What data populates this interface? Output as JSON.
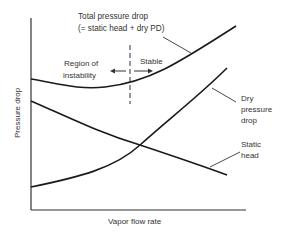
{
  "diagram": {
    "xlabel": "Vapor flow rate",
    "ylabel": "Pressure drop",
    "curves": [
      {
        "id": "total",
        "name": "Total pressure drop",
        "label_lines": [
          "Total pressure drop",
          "(= static head + dry PD)"
        ]
      },
      {
        "id": "dry",
        "name": "Dry pressure drop",
        "label_lines": [
          "Dry",
          "pressure",
          "drop"
        ]
      },
      {
        "id": "static",
        "name": "Static head",
        "label_lines": [
          "Static",
          "head"
        ]
      }
    ],
    "regions": {
      "left_label_lines": [
        "Region of",
        "instability"
      ],
      "right_label": "Stable"
    },
    "colors": {
      "line": "#1a1a1a",
      "axis": "#333333",
      "text": "#333333"
    }
  }
}
